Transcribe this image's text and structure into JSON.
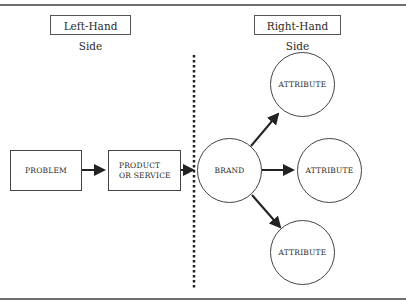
{
  "headers": {
    "left": "Left-Hand Side",
    "right": "Right-Hand Side"
  },
  "nodes": {
    "problem": "PROBLEM",
    "product": "PRODUCT OR SERVICE",
    "brand": "BRAND",
    "attributes": [
      "ATTRIBUTE",
      "ATTRIBUTE",
      "ATTRIBUTE"
    ]
  },
  "edges": [
    {
      "from": "problem",
      "to": "product"
    },
    {
      "from": "product",
      "to": "brand"
    },
    {
      "from": "brand",
      "to": "attribute_top"
    },
    {
      "from": "brand",
      "to": "attribute_right"
    },
    {
      "from": "brand",
      "to": "attribute_bottom"
    }
  ],
  "divider": {
    "style": "dotted",
    "color": "#222222"
  },
  "colors": {
    "line": "#222222",
    "border": "#444444",
    "rule": "#6e6e6e"
  }
}
